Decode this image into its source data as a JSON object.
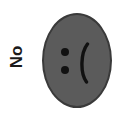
{
  "image": {
    "width": 126,
    "height": 126,
    "background_color": "#ffffff",
    "caption_text": "No"
  },
  "label": {
    "text": "No",
    "rotation_degrees": -90,
    "color": "#1a1a1a"
  },
  "face": {
    "name": "sad-face",
    "shape": "oval",
    "fill_color": "#5b5b5b",
    "border_color": "#3a3a3a",
    "emoticon": ":(",
    "expression": "frowning",
    "rotation_degrees": -90,
    "features": {
      "eyes": {
        "glyph": ":",
        "count": 2,
        "color": "#111111"
      },
      "mouth": {
        "glyph": "(",
        "color": "#111111"
      }
    }
  }
}
